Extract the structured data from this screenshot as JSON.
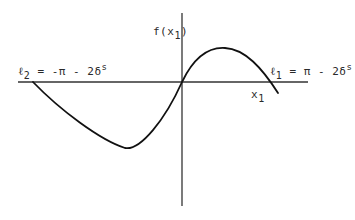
{
  "figure": {
    "y_axis_label": {
      "base": "f(x",
      "sub": "1",
      "close": ")"
    },
    "x_axis_label": {
      "base": "x",
      "sub": "1"
    },
    "left_bound_label": {
      "base": "ℓ",
      "sub": "2",
      "expr": " = -π - 2δ",
      "sup": "s"
    },
    "right_bound_label": {
      "base": "ℓ",
      "sub": "1",
      "expr": " = π - 2δ",
      "sup": "s"
    },
    "colors": {
      "stroke": "#1a1a1a",
      "background": "#ffffff"
    }
  }
}
